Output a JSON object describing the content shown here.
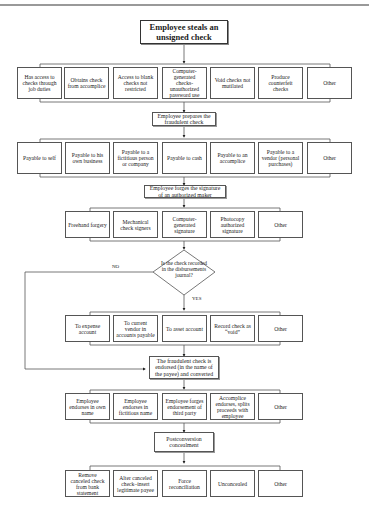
{
  "title": "Employee steals an unsigned check",
  "row1": [
    "Has access to checks through job duties",
    "Obtains check from accomplice",
    "Access to blank checks not restricted",
    "Computer-generated checks-unauthorized password use",
    "Void checks not mutilated",
    "Produce counterfeit checks",
    "Other"
  ],
  "step2": "Employee prepares the fraudulent check",
  "row2": [
    "Payable to self",
    "Payable to his own business",
    "Payable to a fictitious person or company",
    "Payable to cash",
    "Payable to an accomplice",
    "Payable to a vendor (personal purchases)",
    "Other"
  ],
  "step3": "Employee forges the signature of an authorized maker",
  "row3": [
    "Freehand forgery",
    "Mechanical check signers",
    "Computer-generated signature",
    "Photocopy authorized signature",
    "Other"
  ],
  "decision": "Is the check recorded in the disbursements journal?",
  "no_label": "NO",
  "yes_label": "YES",
  "row4": [
    "To expense account",
    "To current vendor in accounts payable",
    "To asset account",
    "Record check as “void”",
    "Other"
  ],
  "step5": "The fraudulent check is endorsed (in the name of the payee) and converted",
  "row5": [
    "Employee endorses in own name",
    "Employee endorses in fictitious name",
    "Employee forges endorsement of third party",
    "Accomplice endorses, splits proceeds with employee",
    "Other"
  ],
  "step6": "Postconversion concealment",
  "row6": [
    "Remove canceled check from bank statement",
    "Alter canceled check–insert legitimate payee",
    "Force reconciliation",
    "Unconcealed",
    "Other"
  ]
}
